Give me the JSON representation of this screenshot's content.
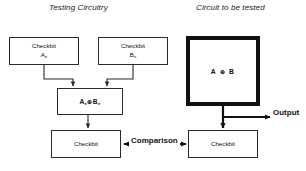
{
  "diagram": {
    "titles": {
      "left": "Testing Circuitry",
      "right": "Circuit to be tested"
    },
    "boxes": {
      "checkbit_a": {
        "line1": "Checkbit",
        "line2_base": "A",
        "line2_sub": "e"
      },
      "checkbit_b": {
        "line1": "Checkbit",
        "line2_base": "B",
        "line2_sub": "e"
      },
      "xor_mid": {
        "a_base": "A",
        "a_sub": "e",
        "op": "⊕",
        "b_base": "B",
        "b_sub": "e"
      },
      "checkbit_bottom_left": {
        "label": "Checkbit"
      },
      "checkbit_bottom_right": {
        "label": "Checkbit"
      },
      "device_under_test": {
        "expr_a": "A",
        "expr_op": "⊕",
        "expr_b": "B"
      }
    },
    "labels": {
      "comparison": "Comparison",
      "output": "Output"
    },
    "colors": {
      "stroke": "#2b2b2b",
      "thick_stroke": "#111111",
      "text": "#111111",
      "background": "#ffffff"
    }
  }
}
